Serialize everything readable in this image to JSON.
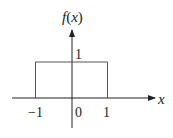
{
  "chart_data": {
    "type": "line",
    "title": "",
    "xlabel": "x",
    "ylabel": "f(x)",
    "xlim": [
      -1.5,
      2.2
    ],
    "ylim": [
      0,
      1
    ],
    "x_ticks": [
      "-1",
      "0",
      "1"
    ],
    "y_ticks": [
      "1"
    ],
    "series": [
      {
        "name": "rectangular pulse",
        "points": [
          [
            -1,
            0
          ],
          [
            -1,
            1
          ],
          [
            1,
            1
          ],
          [
            1,
            0
          ]
        ]
      }
    ]
  },
  "labels": {
    "y_axis": "f(x)",
    "x_axis": "x",
    "tick_neg1": "−1",
    "tick_0": "0",
    "tick_1": "1",
    "height_1": "1"
  },
  "colors": {
    "axis": "#222222",
    "pulse": "#555555"
  }
}
